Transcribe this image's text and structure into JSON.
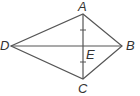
{
  "diagram": {
    "type": "kite",
    "vertices": {
      "A": {
        "label": "A",
        "x": 83,
        "y": 14
      },
      "B": {
        "label": "B",
        "x": 122,
        "y": 46
      },
      "C": {
        "label": "C",
        "x": 83,
        "y": 79
      },
      "D": {
        "label": "D",
        "x": 11,
        "y": 46
      },
      "E": {
        "label": "E",
        "x": 83,
        "y": 46
      }
    },
    "segments": [
      "AB",
      "BC",
      "CD",
      "DA",
      "AC",
      "DB"
    ],
    "congruence_marks": [
      "AE",
      "EC"
    ],
    "colors": {
      "stroke": "#555555",
      "text": "#333333"
    }
  }
}
